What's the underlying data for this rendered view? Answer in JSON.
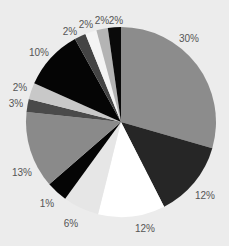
{
  "chart_data": {
    "type": "pie",
    "title": "",
    "start_angle": "top (12 o'clock)",
    "direction": "clockwise",
    "slices": [
      {
        "label": "30%",
        "value": 30,
        "color": "#8c8c8c",
        "start_deg": 0,
        "end_deg": 106
      },
      {
        "label": "12%",
        "value": 12,
        "color": "#262626",
        "start_deg": 106,
        "end_deg": 153
      },
      {
        "label": "12%",
        "value": 12,
        "color": "#ffffff",
        "start_deg": 153,
        "end_deg": 194
      },
      {
        "label": "6%",
        "value": 6,
        "color": "#e6e6e6",
        "start_deg": 194,
        "end_deg": 216
      },
      {
        "label": "1%",
        "value": 1,
        "color": "#050505",
        "start_deg": 216,
        "end_deg": 229
      },
      {
        "label": "13%",
        "value": 13,
        "color": "#8a8a8a",
        "start_deg": 229,
        "end_deg": 276
      },
      {
        "label": "3%",
        "value": 3,
        "color": "#4a4a4a",
        "start_deg": 276,
        "end_deg": 284
      },
      {
        "label": "2%",
        "value": 2,
        "color": "#c8c8c8",
        "start_deg": 284,
        "end_deg": 294
      },
      {
        "label": "10%",
        "value": 10,
        "color": "#050505",
        "start_deg": 294,
        "end_deg": 331
      },
      {
        "label": "2%",
        "value": 2,
        "color": "#444444",
        "start_deg": 331,
        "end_deg": 338
      },
      {
        "label": "2%",
        "value": 2,
        "color": "#f4f4f4",
        "start_deg": 338,
        "end_deg": 345
      },
      {
        "label": "2%",
        "value": 2,
        "color": "#b4b4b4",
        "start_deg": 345,
        "end_deg": 352
      },
      {
        "label": "2%",
        "value": 2,
        "color": "#0a0a0a",
        "start_deg": 352,
        "end_deg": 360
      }
    ],
    "labels": [
      {
        "text": "30%",
        "x": 189,
        "y": 38
      },
      {
        "text": "12%",
        "x": 205,
        "y": 195
      },
      {
        "text": "12%",
        "x": 145,
        "y": 228
      },
      {
        "text": "6%",
        "x": 71,
        "y": 223
      },
      {
        "text": "1%",
        "x": 47,
        "y": 203
      },
      {
        "text": "13%",
        "x": 22,
        "y": 172
      },
      {
        "text": "3%",
        "x": 16,
        "y": 103
      },
      {
        "text": "2%",
        "x": 20,
        "y": 87
      },
      {
        "text": "10%",
        "x": 39,
        "y": 52
      },
      {
        "text": "2%",
        "x": 70,
        "y": 31
      },
      {
        "text": "2%",
        "x": 86,
        "y": 24
      },
      {
        "text": "2%",
        "x": 102,
        "y": 20
      },
      {
        "text": "2%",
        "x": 116,
        "y": 20
      }
    ],
    "center": [
      121,
      122
    ],
    "radius": 95,
    "legend": "none"
  }
}
